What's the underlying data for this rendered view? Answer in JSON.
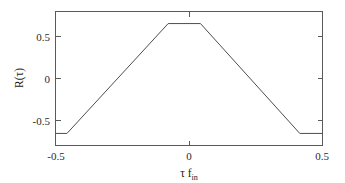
{
  "figure": {
    "background_color": "#ffffff",
    "axes_color": "#5a5a5a",
    "curve_color": "#4d4d4d",
    "text_color": "#1a1a1a"
  },
  "axis": {
    "y_title_main": "R(",
    "y_title_tau": "τ",
    "y_title_close": ")",
    "y_title_full": "R(τ)",
    "x_title_tau": "τ",
    "x_title_f": "f",
    "x_title_sub": "in",
    "x_title_full": "τ f_in",
    "x_ticks": [
      "-0.5",
      "0",
      "0.5"
    ],
    "y_ticks": [
      "0.5",
      "0",
      "-0.5"
    ]
  },
  "chart_data": {
    "type": "line",
    "title": "",
    "subtitle": "",
    "xlabel": "τ f_in",
    "ylabel": "R(τ)",
    "xlim": [
      -0.5,
      0.5
    ],
    "ylim": [
      -0.805,
      0.805
    ],
    "xticks": [
      -0.5,
      0,
      0.5
    ],
    "xticklabels": [
      "-0.5",
      "0",
      "0.5"
    ],
    "yticks": [
      -0.5,
      0,
      0.5
    ],
    "yticklabels": [
      "-0.5",
      "0",
      "0.5"
    ],
    "grid": false,
    "legend": null,
    "series": [
      {
        "name": "R(τ)",
        "color": "#4d4d4d",
        "linewidth": 1,
        "x": [
          -0.5,
          -0.457,
          -0.078,
          0.043,
          0.415,
          0.5
        ],
        "y": [
          -0.66,
          -0.66,
          0.66,
          0.66,
          -0.66,
          -0.66
        ]
      }
    ],
    "annotations": []
  }
}
